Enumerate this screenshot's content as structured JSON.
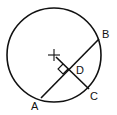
{
  "diagram": {
    "type": "geometry-circle-chord",
    "circle": {
      "cx": 54,
      "cy": 55,
      "r": 47
    },
    "center_mark": {
      "x": 54,
      "y": 55,
      "size": 5
    },
    "points": {
      "A": {
        "x": 41,
        "y": 98
      },
      "B": {
        "x": 99,
        "y": 39
      },
      "C": {
        "x": 89,
        "y": 89
      },
      "D": {
        "x": 69,
        "y": 70
      }
    },
    "labels": {
      "A": "A",
      "B": "B",
      "C": "C",
      "D": "D"
    },
    "stroke_color": "#111111",
    "background": "#ffffff"
  }
}
